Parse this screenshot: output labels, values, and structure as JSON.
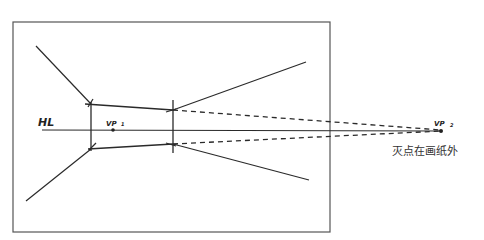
{
  "diagram": {
    "type": "two-point-perspective-sketch",
    "labels": {
      "horizon_line": "HL",
      "vp1": "VP",
      "vp1_sub": "1",
      "vp2": "VP",
      "vp2_sub": "2",
      "caption": "灭点在画纸外"
    },
    "colors": {
      "line": "#2a2a2a",
      "frame": "#555555",
      "text": "#333333"
    },
    "frame": {
      "x": 13,
      "y": 22,
      "width": 317,
      "height": 210
    },
    "horizon_line": {
      "x1": 42,
      "y1": 130,
      "x2": 441,
      "y2": 131
    },
    "vanishing_points": [
      {
        "name": "VP1",
        "x": 113,
        "y": 130
      },
      {
        "name": "VP2",
        "x": 441,
        "y": 131
      }
    ]
  }
}
